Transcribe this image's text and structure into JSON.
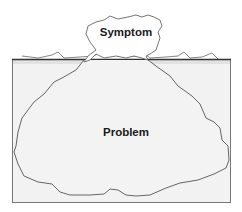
{
  "diagram": {
    "type": "iceberg",
    "above_water": {
      "label": "Symptom"
    },
    "below_water": {
      "label": "Problem"
    },
    "colors": {
      "background": "#ffffff",
      "water_fill": "#f2f2f2",
      "outline": "#555555",
      "waterline": "#333333",
      "text": "#1a1a1a"
    }
  }
}
